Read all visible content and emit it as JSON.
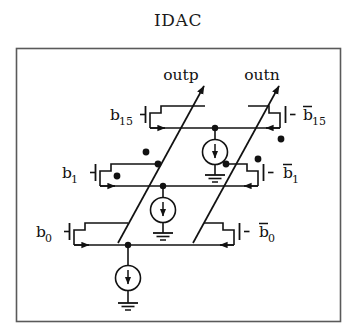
{
  "figure": {
    "title": "IDAC",
    "kind": "circuit-schematic"
  },
  "outputs": [
    {
      "id": "outp",
      "label": "outp"
    },
    {
      "id": "outn",
      "label": "outn"
    }
  ],
  "bit_labels": {
    "left": [
      {
        "id": "b15",
        "base": "b",
        "sub": "15",
        "overbar": false
      },
      {
        "id": "b1",
        "base": "b",
        "sub": "1",
        "overbar": false
      },
      {
        "id": "b0",
        "base": "b",
        "sub": "0",
        "overbar": false
      }
    ],
    "right": [
      {
        "id": "b15n",
        "base": "b",
        "sub": "15",
        "overbar": true
      },
      {
        "id": "b1n",
        "base": "b",
        "sub": "1",
        "overbar": true
      },
      {
        "id": "b0n",
        "base": "b",
        "sub": "0",
        "overbar": true
      }
    ]
  },
  "rows": [
    {
      "id": "row-b15",
      "left_label": "b15",
      "right_label": "b15n",
      "rail_y": 128
    },
    {
      "id": "row-b1",
      "left_label": "b1",
      "right_label": "b1n",
      "rail_y": 186
    },
    {
      "id": "row-b0",
      "left_label": "b0",
      "right_label": "b0n",
      "rail_y": 245
    }
  ],
  "current_sources": [
    {
      "id": "isrc-top",
      "arrow": "down",
      "to": "ground"
    },
    {
      "id": "isrc-middle",
      "arrow": "down",
      "to": "ground"
    },
    {
      "id": "isrc-bottom",
      "arrow": "down",
      "to": "ground"
    }
  ],
  "symbols": {
    "ground": "ground-symbol",
    "current_source": "current-source-symbol",
    "transistor": "mosfet-switch-symbol",
    "junction": "junction-dot"
  },
  "colors": {
    "ink": "#121212",
    "border": "#555555",
    "background": "#ffffff"
  },
  "frame": {
    "x": 16,
    "y": 48,
    "w": 325,
    "h": 274
  }
}
